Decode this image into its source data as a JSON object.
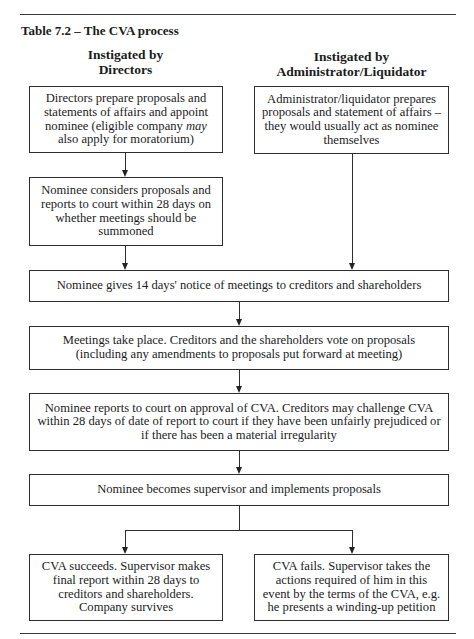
{
  "title": "Table 7.2 – The CVA process",
  "columns": {
    "left": {
      "header_line1": "Instigated by",
      "header_line2": "Directors"
    },
    "right": {
      "header_line1": "Instigated by",
      "header_line2": "Administrator/Liquidator"
    }
  },
  "boxes": {
    "directors_prepare": {
      "text_before": "Directors prepare proposals and statements of affairs and appoint nominee (eligible company ",
      "text_emphasis": "may",
      "text_after": " also apply for moratorium)"
    },
    "administrator_prepares": {
      "text": "Administrator/liquidator prepares proposals and statement of affairs – they would usually act as nominee themselves"
    },
    "nominee_considers": {
      "text": "Nominee considers proposals and reports to court within 28 days on whether meetings should be summoned"
    },
    "notice_of_meetings": {
      "text": "Nominee gives 14 days' notice of meetings to creditors and shareholders"
    },
    "meetings_take_place": {
      "text": "Meetings take place. Creditors and the shareholders vote on proposals (including any amendments to proposals put forward at meeting)"
    },
    "nominee_reports": {
      "text": "Nominee reports to court on approval of CVA. Creditors may challenge CVA within 28 days of date of report to court if they have been unfairly prejudiced or if there has been a material irregularity"
    },
    "becomes_supervisor": {
      "text": "Nominee becomes supervisor and implements proposals"
    },
    "cva_succeeds": {
      "text": "CVA succeeds. Supervisor makes final report within 28 days to creditors and shareholders. Company survives"
    },
    "cva_fails": {
      "text": "CVA fails. Supervisor takes the actions required of him in this event by the terms of the CVA, e.g. he presents a winding-up petition"
    }
  },
  "colors": {
    "line": "#2e2e2e",
    "text": "#1c1c1c",
    "background": "#ffffff"
  }
}
